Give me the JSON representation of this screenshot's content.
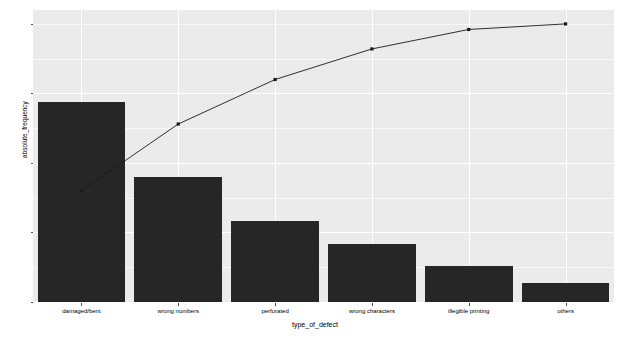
{
  "chart_data": {
    "type": "bar",
    "title": "",
    "subtitle": "",
    "xlabel": "type_of_defect",
    "ylabel": "absolute_frequency",
    "categories": [
      "damaged/bent",
      "wrong numbers",
      "perforated",
      "wrong characters",
      "illegible printing",
      "others"
    ],
    "values": [
      72,
      45,
      29,
      21,
      13,
      7
    ],
    "ylim": [
      0,
      105
    ],
    "yticks": [
      0,
      25,
      50,
      75,
      100
    ],
    "ytick_labels": [
      "0",
      "25",
      "50",
      "75",
      "100"
    ],
    "grid": true,
    "legend": "none",
    "series": [
      {
        "name": "absolute_frequency",
        "type": "bar",
        "color": "#262626",
        "values": [
          72,
          45,
          29,
          21,
          13,
          7
        ]
      },
      {
        "name": "cumulative_percentage",
        "type": "line",
        "color": "#1a1a1a",
        "values": [
          40,
          64,
          80,
          91,
          98,
          100
        ]
      }
    ],
    "panel_background": "#ebebeb",
    "gridline_color": "#ffffff"
  },
  "axes": {
    "y": {
      "title": "absolute_frequency",
      "ticks": [
        {
          "label": "100",
          "value": 100
        },
        {
          "label": "75",
          "value": 75
        },
        {
          "label": "50",
          "value": 50
        },
        {
          "label": "25",
          "value": 25
        },
        {
          "label": "0",
          "value": 0
        }
      ]
    },
    "x": {
      "title": "type_of_defect",
      "ticks": [
        {
          "label": "damaged/bent"
        },
        {
          "label": "wrong numbers"
        },
        {
          "label": "perforated"
        },
        {
          "label": "wrong characters"
        },
        {
          "label": "illegible printing"
        },
        {
          "label": "others"
        }
      ]
    }
  }
}
